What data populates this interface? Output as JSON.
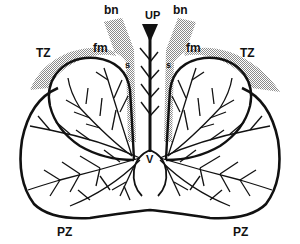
{
  "diagram": {
    "type": "anatomical-section",
    "colors": {
      "outline": "#111111",
      "stipple": "#9a9a9a",
      "background": "#ffffff"
    },
    "labels": {
      "urethra": "UP",
      "bladder_neck_left": "bn",
      "bladder_neck_right": "bn",
      "transition_zone_left": "TZ",
      "transition_zone_right": "TZ",
      "fibromuscular_left": "fm",
      "fibromuscular_right": "fm",
      "sphincter_left": "s",
      "sphincter_right": "s",
      "verumontanum": "V",
      "peripheral_zone_left": "PZ",
      "peripheral_zone_right": "PZ"
    }
  }
}
